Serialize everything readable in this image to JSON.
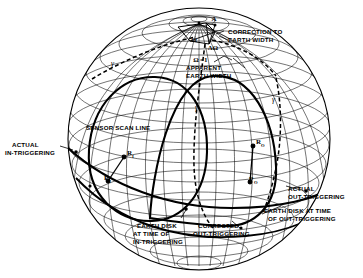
{
  "figure": {
    "background_color": "#ffffff",
    "line_color": "#000000",
    "sphere": {
      "cx": 199,
      "cy": 139,
      "rx": 131,
      "ry": 131
    }
  },
  "labels": {
    "correction_line1": "CORRECTION TO",
    "correction_line2": "EARTH WIDTH",
    "apparent_line1": "APPARENT",
    "apparent_line2": "EARTH WIDTH",
    "sensor_scan_line": "SENSOR SCAN LINE",
    "actual_in_line1": "ACTUAL",
    "actual_in_line2": "IN-TRIGGERING",
    "actual_out_line1": "ACTUAL",
    "actual_out_line2": "OUT-TRIGGERING",
    "earth_disk_in_line1": "EARTH DISK",
    "earth_disk_in_line2": "AT TIME OF",
    "earth_disk_in_line3": "IN-TRIGGERING",
    "corrected_out_line1": "CORRECTED",
    "corrected_out_line2": "OUT-TRIGGERING",
    "earth_disk_out_line1": "EARTH DISK AT TIME",
    "earth_disk_out_line2": "OF OUT-TRIGGERING"
  },
  "symbols": {
    "point_a": "A",
    "omega": "Ω",
    "delta_omega": "ΔΩ",
    "omega_eq_1": "Ω",
    "omega_eq_1_suffix": "=1",
    "gamma": "γ",
    "r_in": "R",
    "r_in_sub": "I",
    "p_in": "P",
    "p_in_sub": "I",
    "r_out": "R",
    "r_out_sub": "O",
    "p_out": "P",
    "p_out_sub": "O"
  },
  "colors": {
    "ink": "#000000",
    "paper": "#ffffff"
  }
}
